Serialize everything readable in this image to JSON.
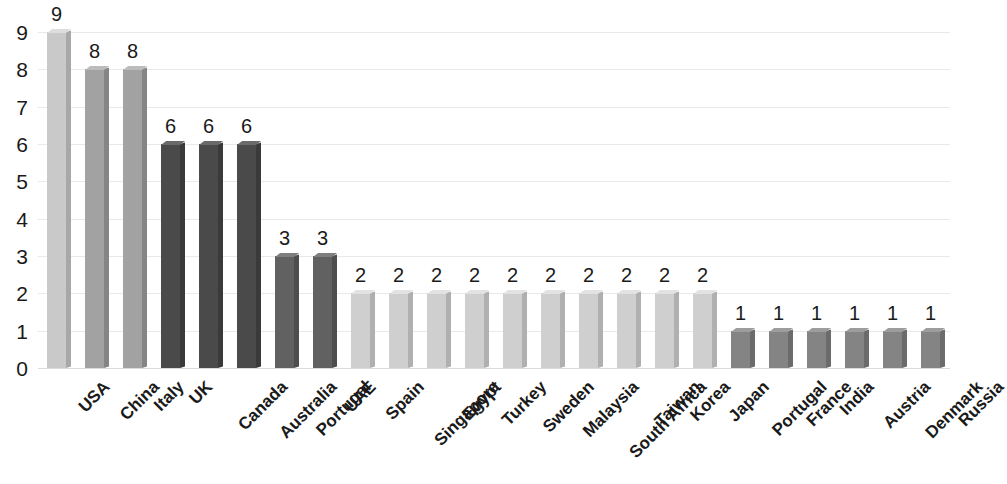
{
  "chart_data": {
    "type": "bar",
    "title": "",
    "subtitle": "",
    "xlabel": "",
    "ylabel": "",
    "ylim": [
      0,
      9
    ],
    "y_ticks": [
      0,
      1,
      2,
      3,
      4,
      5,
      6,
      7,
      8,
      9
    ],
    "grid": true,
    "legend": "none",
    "style": "3d-column",
    "categories": [
      "USA",
      "China",
      "Italy",
      "UK",
      "Canada",
      "Australia",
      "Portugal",
      "UAE",
      "Spain",
      "Singapore",
      "Egypt",
      "Turkey",
      "Sweden",
      "Malaysia",
      "South Africa",
      "Taiwan",
      "Korea",
      "Japan",
      "Portugal",
      "France",
      "India",
      "Austria",
      "Denmark",
      "Russia"
    ],
    "values": [
      9,
      8,
      8,
      6,
      6,
      6,
      3,
      3,
      2,
      2,
      2,
      2,
      2,
      2,
      2,
      2,
      2,
      2,
      1,
      1,
      1,
      1,
      1,
      1
    ],
    "data_labels": [
      "9",
      "8",
      "8",
      "6",
      "6",
      "6",
      "3",
      "3",
      "2",
      "2",
      "2",
      "2",
      "2",
      "2",
      "2",
      "2",
      "2",
      "2",
      "1",
      "1",
      "1",
      "1",
      "1",
      "1"
    ],
    "bar_colors": [
      "#c9c9c9",
      "#a2a2a2",
      "#a2a2a2",
      "#4a4a4a",
      "#4a4a4a",
      "#4a4a4a",
      "#616161",
      "#616161",
      "#cfcfcf",
      "#cfcfcf",
      "#cfcfcf",
      "#cfcfcf",
      "#cfcfcf",
      "#cfcfcf",
      "#cfcfcf",
      "#cfcfcf",
      "#cfcfcf",
      "#cfcfcf",
      "#848484",
      "#848484",
      "#848484",
      "#848484",
      "#848484",
      "#848484"
    ],
    "bar_side_colors": [
      "#a8a8a8",
      "#858585",
      "#858585",
      "#3a3a3a",
      "#3a3a3a",
      "#3a3a3a",
      "#4e4e4e",
      "#4e4e4e",
      "#b0b0b0",
      "#b0b0b0",
      "#b0b0b0",
      "#b0b0b0",
      "#b0b0b0",
      "#b0b0b0",
      "#b0b0b0",
      "#b0b0b0",
      "#b0b0b0",
      "#b0b0b0",
      "#6b6b6b",
      "#6b6b6b",
      "#6b6b6b",
      "#6b6b6b",
      "#6b6b6b",
      "#6b6b6b"
    ],
    "bar_top_colors": [
      "#dddddd",
      "#bcbcbc",
      "#bcbcbc",
      "#6a6a6a",
      "#6a6a6a",
      "#6a6a6a",
      "#7e7e7e",
      "#7e7e7e",
      "#e2e2e2",
      "#e2e2e2",
      "#e2e2e2",
      "#e2e2e2",
      "#e2e2e2",
      "#e2e2e2",
      "#e2e2e2",
      "#e2e2e2",
      "#e2e2e2",
      "#e2e2e2",
      "#9d9d9d",
      "#9d9d9d",
      "#9d9d9d",
      "#9d9d9d",
      "#9d9d9d",
      "#9d9d9d"
    ]
  },
  "axis": {
    "y_tick_labels": [
      "9",
      "8",
      "7",
      "6",
      "5",
      "4",
      "3",
      "2",
      "1",
      "0"
    ]
  },
  "colors": {
    "background": "#ffffff",
    "gridline": "#e9e9e9",
    "text": "#1a1a1a"
  }
}
